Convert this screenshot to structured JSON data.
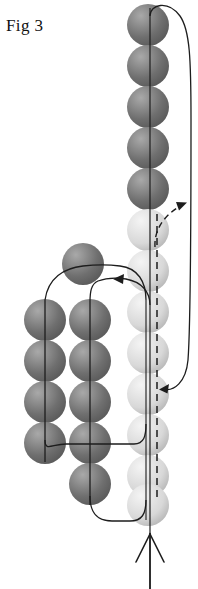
{
  "figure": {
    "caption": "Fig 3",
    "width": 198,
    "height": 589,
    "background": "#ffffff"
  },
  "palette": {
    "sphere_dark_base": "#6f6f6f",
    "sphere_dark_highlight": "#a9a9a9",
    "sphere_dark_shadow": "#4a4a4a",
    "sphere_light_base": "#d8d8d8",
    "sphere_light_highlight": "#f4f4f4",
    "sphere_light_shadow": "#9d9d9d",
    "line_color": "#1d1d1d",
    "caption_color": "#111111"
  },
  "chart_data": {
    "type": "diagram",
    "title": "Fig 3",
    "sphere_radius": 21,
    "columns": [
      {
        "name": "left-dark-column",
        "shade": "dark",
        "cx": 45,
        "count": 4,
        "cy_values": [
          320,
          361,
          402,
          443
        ]
      },
      {
        "name": "middle-dark-column",
        "shade": "dark",
        "cx": 90,
        "count": 5,
        "cy_values": [
          320,
          361,
          402,
          443,
          484
        ]
      },
      {
        "name": "upper-left-dark-single",
        "shade": "dark",
        "cx": 83,
        "count": 1,
        "cy_values": [
          264
        ]
      },
      {
        "name": "top-dark-column",
        "shade": "dark",
        "cx": 148,
        "count": 5,
        "cy_values": [
          25,
          66,
          107,
          148,
          189
        ]
      },
      {
        "name": "right-light-column",
        "shade": "light",
        "cx": 148,
        "count": 8,
        "cy_values": [
          230,
          271,
          312,
          353,
          394,
          435,
          476,
          505
        ]
      }
    ],
    "lines": [
      {
        "name": "main-vertical-axis",
        "style": "solid",
        "orientation": "vertical",
        "x": 150,
        "y_from": 8,
        "y_to": 589
      },
      {
        "name": "dashed-vertical-axis",
        "style": "dashed",
        "orientation": "vertical",
        "x": 157,
        "y_from": 212,
        "y_to": 500
      },
      {
        "name": "outer-right-return-loop",
        "style": "solid",
        "shape": "large-arc-right"
      },
      {
        "name": "dashed-branch-arrow",
        "style": "dashed",
        "shape": "curve-up-right"
      },
      {
        "name": "left-cluster-feed-curve",
        "style": "solid",
        "shape": "curve-left-down"
      },
      {
        "name": "middle-cluster-feed-curve",
        "style": "solid",
        "shape": "curve-left-down"
      },
      {
        "name": "bottom-return-loop",
        "style": "solid",
        "shape": "u-turn"
      }
    ],
    "arrows": [
      {
        "name": "inlet-arrow",
        "direction": "up",
        "head_style": "open-v",
        "tip_x": 150,
        "tip_y": 532,
        "tail_y": 589
      },
      {
        "name": "dashed-branch-arrowhead",
        "direction": "up-right",
        "head_style": "solid",
        "tip_x": 186,
        "tip_y": 202
      },
      {
        "name": "right-loop-arrowhead",
        "direction": "down-left",
        "head_style": "solid",
        "tip_x": 160,
        "tip_y": 389
      },
      {
        "name": "mid-feed-arrowhead",
        "direction": "left",
        "head_style": "solid",
        "tip_x": 115,
        "tip_y": 279
      }
    ]
  }
}
